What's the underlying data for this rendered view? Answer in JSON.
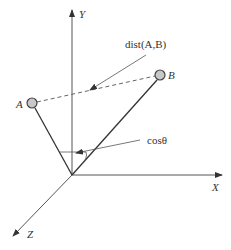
{
  "diagram": {
    "axes": {
      "y_label": "Y",
      "x_label": "X",
      "z_label": "Z"
    },
    "points": {
      "a_label": "A",
      "b_label": "B"
    },
    "annotations": {
      "distance_label": "dist(A,B)",
      "cosine_label": "cosθ"
    },
    "colors": {
      "line": "#333333",
      "axis": "#555555",
      "point_fill": "#c8c8c8",
      "point_stroke": "#444444"
    }
  }
}
